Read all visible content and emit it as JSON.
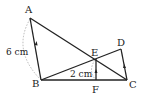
{
  "diagram": {
    "points": {
      "A": {
        "label": "A",
        "x": 30,
        "y": 18
      },
      "B": {
        "label": "B",
        "x": 41,
        "y": 80
      },
      "C": {
        "label": "C",
        "x": 127,
        "y": 80
      },
      "D": {
        "label": "D",
        "x": 121,
        "y": 49
      },
      "E": {
        "label": "E",
        "x": 96,
        "y": 59
      },
      "F": {
        "label": "F",
        "x": 96,
        "y": 80
      }
    },
    "segments": [
      "AB",
      "AC",
      "BC",
      "BD",
      "DC",
      "EF"
    ],
    "parallel_marks": [
      "AB",
      "EF",
      "DC"
    ],
    "measurements": {
      "AB": "6 cm",
      "EF": "2 cm"
    },
    "colors": {
      "line": "#222222",
      "dashed": "#999999"
    }
  }
}
